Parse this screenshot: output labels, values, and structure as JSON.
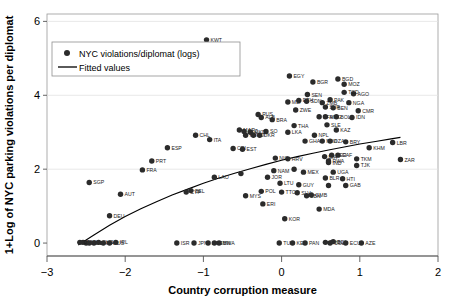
{
  "chart_data": {
    "type": "scatter",
    "title": "",
    "xlabel": "Country corruption measure",
    "ylabel": "1+Log of NYC parking violations per diplomat",
    "xlim": [
      -3,
      2
    ],
    "ylim": [
      -0.35,
      6.2
    ],
    "xticks": [
      -3,
      -2,
      -1,
      0,
      1,
      2
    ],
    "xticklabels": [
      "−3",
      "−2",
      "−1",
      "0",
      "1",
      "2"
    ],
    "yticks": [
      0,
      2,
      4,
      6
    ],
    "yticklabels": [
      "0",
      "2",
      "4",
      "6"
    ],
    "grid": "horizontal",
    "legend_position": "upper-left",
    "legend": [
      {
        "marker": "circle",
        "label": "NYC violations/diplomat (logs)"
      },
      {
        "marker": "line",
        "label": "Fitted values"
      }
    ],
    "series": [
      {
        "name": "NYC violations/diplomat (logs)",
        "marker": "filled-circle",
        "color": "#2b2b2b",
        "points": [
          {
            "label": "KWT",
            "x": -0.96,
            "y": 5.5
          },
          {
            "label": "EGY",
            "x": 0.1,
            "y": 4.52
          },
          {
            "label": "BGR",
            "x": 0.4,
            "y": 4.36
          },
          {
            "label": "BGD",
            "x": 0.72,
            "y": 4.44
          },
          {
            "label": "MOZ",
            "x": 0.8,
            "y": 4.3
          },
          {
            "label": "SEN",
            "x": 0.33,
            "y": 4.02
          },
          {
            "label": "AGO",
            "x": 0.92,
            "y": 4.04
          },
          {
            "label": "TCD",
            "x": 0.8,
            "y": 4.08
          },
          {
            "label": "PAK",
            "x": 0.62,
            "y": 3.88
          },
          {
            "label": "NGA",
            "x": 0.86,
            "y": 3.8
          },
          {
            "label": "ETH",
            "x": 0.22,
            "y": 3.86
          },
          {
            "label": "SDN",
            "x": 0.32,
            "y": 3.84
          },
          {
            "label": "ZMB",
            "x": 0.52,
            "y": 3.8
          },
          {
            "label": "MLI",
            "x": 0.08,
            "y": 3.82
          },
          {
            "label": "SYR",
            "x": 0.56,
            "y": 3.68
          },
          {
            "label": "BEN",
            "x": 0.66,
            "y": 3.66
          },
          {
            "label": "ZWE",
            "x": 0.18,
            "y": 3.6
          },
          {
            "label": "CMR",
            "x": 0.98,
            "y": 3.58
          },
          {
            "label": "BFA",
            "x": 0.48,
            "y": 3.42
          },
          {
            "label": "MNG",
            "x": 0.56,
            "y": 3.42
          },
          {
            "label": "BOL",
            "x": 0.7,
            "y": 3.42
          },
          {
            "label": "IDN",
            "x": 0.9,
            "y": 3.4
          },
          {
            "label": "RUS",
            "x": -0.3,
            "y": 3.48
          },
          {
            "label": "ALB",
            "x": -0.26,
            "y": 3.4
          },
          {
            "label": "BRA",
            "x": -0.12,
            "y": 3.34
          },
          {
            "label": "CHL",
            "x": -1.1,
            "y": 2.92
          },
          {
            "label": "ITA",
            "x": -0.92,
            "y": 2.8
          },
          {
            "label": "THA",
            "x": 0.16,
            "y": 3.18
          },
          {
            "label": "SLE",
            "x": 0.58,
            "y": 3.2
          },
          {
            "label": "MAR",
            "x": -0.54,
            "y": 3.06
          },
          {
            "label": "BLZ",
            "x": -0.48,
            "y": 3.02
          },
          {
            "label": "HUN",
            "x": -0.46,
            "y": 2.92
          },
          {
            "label": "SO",
            "x": -0.2,
            "y": 3.02
          },
          {
            "label": "MKD",
            "x": -0.4,
            "y": 3.0
          },
          {
            "label": "DJI",
            "x": -0.36,
            "y": 2.92
          },
          {
            "label": "UKR",
            "x": -0.28,
            "y": 2.92
          },
          {
            "label": "LKA",
            "x": 0.08,
            "y": 3.0
          },
          {
            "label": "KAZ",
            "x": 0.7,
            "y": 3.06
          },
          {
            "label": "NPL",
            "x": 0.42,
            "y": 2.92
          },
          {
            "label": "ESP",
            "x": -1.46,
            "y": 2.58
          },
          {
            "label": "CRI",
            "x": -0.62,
            "y": 2.56
          },
          {
            "label": "EST",
            "x": -0.5,
            "y": 2.54
          },
          {
            "label": "MWI",
            "x": 0.52,
            "y": 2.76
          },
          {
            "label": "GHA",
            "x": 0.3,
            "y": 2.76
          },
          {
            "label": "DZA",
            "x": 0.62,
            "y": 2.76
          },
          {
            "label": "BRY",
            "x": 0.82,
            "y": 2.74
          },
          {
            "label": "LBR",
            "x": 1.42,
            "y": 2.72
          },
          {
            "label": "KHM",
            "x": 1.12,
            "y": 2.58
          },
          {
            "label": "PRT",
            "x": -1.66,
            "y": 2.22
          },
          {
            "label": "FRA",
            "x": -1.78,
            "y": 1.98
          },
          {
            "label": "LAO",
            "x": -0.86,
            "y": 1.78
          },
          {
            "label": "HRV",
            "x": 0.08,
            "y": 2.28
          },
          {
            "label": "NIC",
            "x": -0.08,
            "y": 2.3
          },
          {
            "label": "BIH",
            "x": 0.55,
            "y": 2.34
          },
          {
            "label": "RWA",
            "x": 0.6,
            "y": 2.22
          },
          {
            "label": "IND",
            "x": 0.6,
            "y": 2.18
          },
          {
            "label": "NER",
            "x": 0.64,
            "y": 2.38
          },
          {
            "label": "CAF",
            "x": 0.72,
            "y": 2.38
          },
          {
            "label": "TKM",
            "x": 0.96,
            "y": 2.28
          },
          {
            "label": "ZAR",
            "x": 1.52,
            "y": 2.26
          },
          {
            "label": "TJK",
            "x": 0.96,
            "y": 2.1
          },
          {
            "label": "SGP",
            "x": -2.46,
            "y": 1.64
          },
          {
            "label": "UGA",
            "x": 0.66,
            "y": 1.92
          },
          {
            "label": "SEN2",
            "x": 0.16,
            "y": 2.0
          },
          {
            "label": "NAM",
            "x": -0.1,
            "y": 1.96
          },
          {
            "label": "MEX",
            "x": 0.28,
            "y": 1.92
          },
          {
            "label": "HUN2",
            "x": -0.52,
            "y": 1.88
          },
          {
            "label": "JOR",
            "x": -0.18,
            "y": 1.78
          },
          {
            "label": "BLR",
            "x": 0.56,
            "y": 1.76
          },
          {
            "label": "HTI",
            "x": 0.78,
            "y": 1.74
          },
          {
            "label": "LTU",
            "x": -0.02,
            "y": 1.62
          },
          {
            "label": "GUY",
            "x": 0.22,
            "y": 1.58
          },
          {
            "label": "RUS2",
            "x": 0.6,
            "y": 1.56
          },
          {
            "label": "GAB",
            "x": 0.82,
            "y": 1.56
          },
          {
            "label": "AUT",
            "x": -2.06,
            "y": 1.32
          },
          {
            "label": "CYP",
            "x": -1.22,
            "y": 1.38
          },
          {
            "label": "BEL",
            "x": -1.16,
            "y": 1.42
          },
          {
            "label": "POL",
            "x": -0.26,
            "y": 1.4
          },
          {
            "label": "TTO",
            "x": 0.0,
            "y": 1.38
          },
          {
            "label": "SLV",
            "x": 0.2,
            "y": 1.36
          },
          {
            "label": "LBN",
            "x": 0.32,
            "y": 1.28
          },
          {
            "label": "GMB",
            "x": 0.38,
            "y": 1.3
          },
          {
            "label": "MYS",
            "x": -0.46,
            "y": 1.28
          },
          {
            "label": "DEU",
            "x": -2.2,
            "y": 0.74
          },
          {
            "label": "ERI",
            "x": -0.24,
            "y": 1.06
          },
          {
            "label": "MDA",
            "x": 0.48,
            "y": 0.92
          },
          {
            "label": "KOR",
            "x": 0.04,
            "y": 0.66
          },
          {
            "label": "NLD",
            "x": -2.54,
            "y": 0.02
          },
          {
            "label": "GBR",
            "x": -2.5,
            "y": 0.0
          },
          {
            "label": "DNK",
            "x": -2.58,
            "y": 0.02
          },
          {
            "label": "SWE",
            "x": -2.46,
            "y": 0.0
          },
          {
            "label": "NOR",
            "x": -2.4,
            "y": 0.0
          },
          {
            "label": "CHE",
            "x": -2.34,
            "y": 0.02
          },
          {
            "label": "CAN",
            "x": -2.28,
            "y": 0.0
          },
          {
            "label": "AUS",
            "x": -2.2,
            "y": 0.0
          },
          {
            "label": "IRL",
            "x": -2.12,
            "y": 0.02
          },
          {
            "label": "ISR",
            "x": -1.34,
            "y": 0.0
          },
          {
            "label": "JPN",
            "x": -1.12,
            "y": 0.0
          },
          {
            "label": "ARE",
            "x": -0.94,
            "y": 0.0
          },
          {
            "label": "OMN",
            "x": -0.86,
            "y": 0.0
          },
          {
            "label": "BWA",
            "x": -0.8,
            "y": 0.0
          },
          {
            "label": "TUR",
            "x": -0.03,
            "y": 0.0
          },
          {
            "label": "KEN",
            "x": 0.14,
            "y": 0.0
          },
          {
            "label": "PAN",
            "x": 0.3,
            "y": 0.0
          },
          {
            "label": "PNG",
            "x": 0.56,
            "y": 0.02
          },
          {
            "label": "COL",
            "x": 0.62,
            "y": 0.0
          },
          {
            "label": "BDI",
            "x": 0.66,
            "y": 0.04
          },
          {
            "label": "ECU",
            "x": 0.82,
            "y": 0.0
          },
          {
            "label": "AZE",
            "x": 1.02,
            "y": 0.0
          }
        ]
      }
    ],
    "fitted_curve": {
      "name": "Fitted values",
      "color": "#000000",
      "points": [
        {
          "x": -2.6,
          "y": -0.05
        },
        {
          "x": -2.4,
          "y": 0.22
        },
        {
          "x": -2.2,
          "y": 0.48
        },
        {
          "x": -2.0,
          "y": 0.72
        },
        {
          "x": -1.8,
          "y": 0.93
        },
        {
          "x": -1.6,
          "y": 1.12
        },
        {
          "x": -1.4,
          "y": 1.3
        },
        {
          "x": -1.2,
          "y": 1.46
        },
        {
          "x": -1.0,
          "y": 1.62
        },
        {
          "x": -0.8,
          "y": 1.76
        },
        {
          "x": -0.6,
          "y": 1.89
        },
        {
          "x": -0.4,
          "y": 2.01
        },
        {
          "x": -0.2,
          "y": 2.13
        },
        {
          "x": 0.0,
          "y": 2.24
        },
        {
          "x": 0.2,
          "y": 2.34
        },
        {
          "x": 0.4,
          "y": 2.43
        },
        {
          "x": 0.6,
          "y": 2.52
        },
        {
          "x": 0.8,
          "y": 2.6
        },
        {
          "x": 1.0,
          "y": 2.68
        },
        {
          "x": 1.2,
          "y": 2.75
        },
        {
          "x": 1.4,
          "y": 2.82
        },
        {
          "x": 1.52,
          "y": 2.86
        }
      ]
    }
  }
}
